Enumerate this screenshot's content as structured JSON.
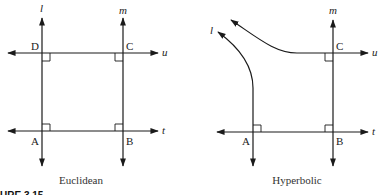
{
  "figure_caption_fragment": "URE 3.15",
  "euclidean": {
    "caption": "Euclidean",
    "line_labels": {
      "l": "l",
      "m": "m",
      "u": "u",
      "t": "t"
    },
    "point_labels": {
      "A": "A",
      "B": "B",
      "C": "C",
      "D": "D"
    },
    "right_angles": [
      "A",
      "B",
      "C",
      "D"
    ]
  },
  "hyperbolic": {
    "caption": "Hyperbolic",
    "line_labels": {
      "l": "l",
      "m": "m",
      "u": "u",
      "t": "t"
    },
    "point_labels": {
      "A": "A",
      "B": "B",
      "C": "C"
    },
    "right_angles": [
      "A",
      "B",
      "C"
    ]
  },
  "colors": {
    "stroke": "#1a1a1a",
    "background": "#ffffff"
  }
}
